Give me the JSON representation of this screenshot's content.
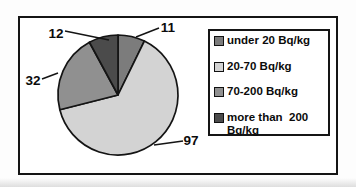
{
  "figure": {
    "background": "#fdfdfd",
    "frame_color": "#151515"
  },
  "chart_data": {
    "type": "pie",
    "title": "",
    "unit": "Bq/kg",
    "categories": [
      "under 20 Bq/kg",
      "20-70 Bq/kg",
      "70-200 Bq/kg",
      "more than  200 Bq/kg"
    ],
    "values": [
      11,
      97,
      32,
      12
    ],
    "total": 152,
    "colors": [
      "#7c7c7c",
      "#d3d3d3",
      "#909090",
      "#4b4b4b"
    ],
    "start_angle_deg": 0,
    "direction": "clockwise",
    "legend_position": "right",
    "data_labels": [
      "11",
      "97",
      "32",
      "12"
    ],
    "layout": {
      "pie_center": {
        "x": 118,
        "y": 95
      },
      "pie_radius": 60,
      "stroke_color": "#141414",
      "labels": [
        {
          "text": "11",
          "x": 168,
          "y": 27,
          "line": [
            159,
            28,
            136,
            37
          ]
        },
        {
          "text": "97",
          "x": 191,
          "y": 140,
          "line": [
            183,
            141,
            154,
            145
          ]
        },
        {
          "text": "32",
          "x": 33,
          "y": 80,
          "line": [
            42,
            79,
            58,
            73
          ]
        },
        {
          "text": "12",
          "x": 56,
          "y": 33,
          "line": [
            65,
            31,
            109,
            40
          ]
        }
      ]
    }
  },
  "legend": {
    "items": [
      {
        "label": "under 20 Bq/kg",
        "color": "#7c7c7c"
      },
      {
        "label": "20-70 Bq/kg",
        "color": "#d3d3d3"
      },
      {
        "label": "70-200 Bq/kg",
        "color": "#909090"
      },
      {
        "label": "more than  200 Bq/kg",
        "color": "#4b4b4b"
      }
    ]
  }
}
